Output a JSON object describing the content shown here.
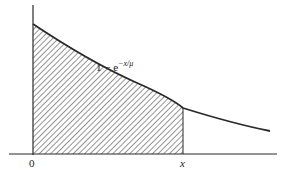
{
  "figure": {
    "curve_label": {
      "prefix": "1 − e",
      "exponent": "−x/μ"
    },
    "x_axis_labels": {
      "origin": "0",
      "x_marker": "x"
    },
    "colors": {
      "stroke": "#2a2a2a",
      "hatch": "#3a3a3a",
      "background": "#ffffff"
    }
  }
}
